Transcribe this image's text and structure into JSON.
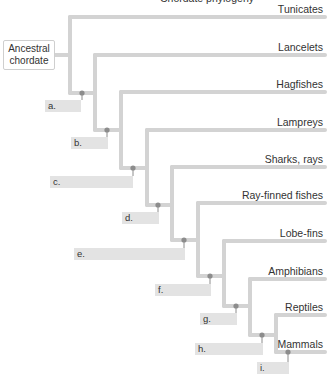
{
  "diagram": {
    "type": "cladogram",
    "clipped_title": "Chordate phylogeny",
    "ancestor_label": "Ancestral chordate",
    "colors": {
      "branch": "#d3d3d3",
      "node": "#8c8c8c",
      "answer_box": "#e3e3e3",
      "text": "#333333"
    },
    "taxa": [
      {
        "name": "Tunicates",
        "y": 17
      },
      {
        "name": "Lancelets",
        "y": 55
      },
      {
        "name": "Hagfishes",
        "y": 92
      },
      {
        "name": "Lampreys",
        "y": 130
      },
      {
        "name": "Sharks, rays",
        "y": 167
      },
      {
        "name": "Ray-finned fishes",
        "y": 203
      },
      {
        "name": "Lobe-fins",
        "y": 241
      },
      {
        "name": "Amphibians",
        "y": 279
      },
      {
        "name": "Reptiles",
        "y": 315
      },
      {
        "name": "Mammals",
        "y": 352
      }
    ],
    "nodes": [
      {
        "label": "a.",
        "x": 82,
        "y": 93,
        "box": {
          "x": 45,
          "y": 100,
          "w": 36
        }
      },
      {
        "label": "b.",
        "x": 107,
        "y": 130,
        "box": {
          "x": 71,
          "y": 137,
          "w": 37
        }
      },
      {
        "label": "c.",
        "x": 133,
        "y": 168,
        "box": {
          "x": 50,
          "y": 176,
          "w": 83
        }
      },
      {
        "label": "d.",
        "x": 158,
        "y": 205,
        "box": {
          "x": 122,
          "y": 212,
          "w": 37
        }
      },
      {
        "label": "e.",
        "x": 184,
        "y": 240,
        "box": {
          "x": 74,
          "y": 248,
          "w": 111
        }
      },
      {
        "label": "f.",
        "x": 210,
        "y": 276,
        "box": {
          "x": 155,
          "y": 284,
          "w": 56
        }
      },
      {
        "label": "g.",
        "x": 236,
        "y": 306,
        "box": {
          "x": 200,
          "y": 313,
          "w": 37
        }
      },
      {
        "label": "h.",
        "x": 262,
        "y": 335,
        "box": {
          "x": 195,
          "y": 343,
          "w": 68
        }
      },
      {
        "label": "i.",
        "x": 288,
        "y": 352,
        "box": {
          "x": 257,
          "y": 362,
          "w": 32
        }
      }
    ],
    "verticals": [
      {
        "x": 70,
        "top": 17,
        "bottom": 93
      },
      {
        "x": 95,
        "top": 55,
        "bottom": 130
      },
      {
        "x": 121,
        "top": 92,
        "bottom": 168
      },
      {
        "x": 147,
        "top": 130,
        "bottom": 205
      },
      {
        "x": 172,
        "top": 167,
        "bottom": 240
      },
      {
        "x": 198,
        "top": 203,
        "bottom": 276
      },
      {
        "x": 224,
        "top": 241,
        "bottom": 306
      },
      {
        "x": 250,
        "top": 279,
        "bottom": 335
      },
      {
        "x": 276,
        "top": 315,
        "bottom": 352
      }
    ],
    "right_edge": 325
  }
}
